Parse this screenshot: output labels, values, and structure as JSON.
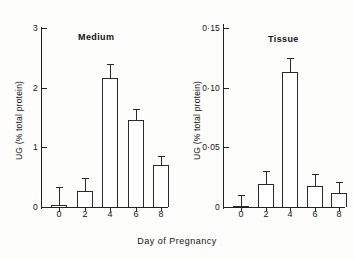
{
  "figure": {
    "xlabel": "Day of Pregnancy",
    "ylabel": "UG (% total protein)",
    "background": "#fdfdfc",
    "ink": "#222222"
  },
  "panels": [
    {
      "key": "medium",
      "title": "Medium",
      "ylabel": "UG (% total protein)",
      "yticks": [
        "0",
        "1",
        "2",
        "3"
      ],
      "xticks": [
        "0",
        "2",
        "4",
        "6",
        "8"
      ]
    },
    {
      "key": "tissue",
      "title": "Tissue",
      "ylabel": "UG (% total protein)",
      "yticks": [
        "0",
        "0·05",
        "0·10",
        "0·15"
      ],
      "xticks": [
        "0",
        "2",
        "4",
        "6",
        "8"
      ]
    }
  ],
  "chart_data": [
    {
      "type": "bar",
      "title": "Medium",
      "xlabel": "Day of Pregnancy",
      "ylabel": "UG (% total protein)",
      "categories": [
        "0",
        "2",
        "4",
        "6",
        "8"
      ],
      "values": [
        0.03,
        0.27,
        2.17,
        1.45,
        0.7
      ],
      "errors": [
        0.3,
        0.22,
        0.22,
        0.2,
        0.15
      ],
      "ylim": [
        0,
        3
      ],
      "ytick_values": [
        0,
        1,
        2,
        3
      ],
      "ytick_labels": [
        "0",
        "1",
        "2",
        "3"
      ],
      "grid": false,
      "legend": "none",
      "error_bar_style": "upper-only-with-cap"
    },
    {
      "type": "bar",
      "title": "Tissue",
      "xlabel": "Day of Pregnancy",
      "ylabel": "UG (% total protein)",
      "categories": [
        "0",
        "2",
        "4",
        "6",
        "8"
      ],
      "values": [
        0.001,
        0.019,
        0.113,
        0.018,
        0.012
      ],
      "errors": [
        0.009,
        0.011,
        0.012,
        0.01,
        0.009
      ],
      "ylim": [
        0,
        0.15
      ],
      "ytick_values": [
        0,
        0.05,
        0.1,
        0.15
      ],
      "ytick_labels": [
        "0",
        "0·05",
        "0·10",
        "0·15"
      ],
      "grid": false,
      "legend": "none",
      "error_bar_style": "upper-only-with-cap"
    }
  ]
}
